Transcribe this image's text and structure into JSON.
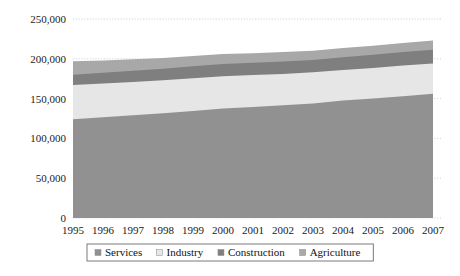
{
  "chart_data": {
    "type": "area",
    "stacked": true,
    "title": "",
    "subtitle": "",
    "xlabel": "",
    "ylabel": "",
    "categories": [
      "1995",
      "1996",
      "1997",
      "1998",
      "1999",
      "2000",
      "2001",
      "2002",
      "2003",
      "2004",
      "2005",
      "2006",
      "2007"
    ],
    "x": [
      1995,
      1996,
      1997,
      1998,
      1999,
      2000,
      2001,
      2002,
      2003,
      2004,
      2005,
      2006,
      2007
    ],
    "series": [
      {
        "name": "Services",
        "color": "#919191",
        "values": [
          124000,
          126500,
          129000,
          131500,
          134500,
          137500,
          139500,
          141500,
          144000,
          147500,
          150000,
          153000,
          156000
        ]
      },
      {
        "name": "Industry",
        "color": "#e6e6e6",
        "values": [
          43000,
          42500,
          42000,
          41500,
          41000,
          40500,
          40000,
          39500,
          39000,
          38500,
          38500,
          38500,
          38000
        ]
      },
      {
        "name": "Construction",
        "color": "#7f7f7f",
        "values": [
          13000,
          13500,
          14000,
          14500,
          15000,
          15500,
          15500,
          15500,
          15500,
          16000,
          16500,
          17000,
          17500
        ]
      },
      {
        "name": "Agriculture",
        "color": "#a8a8a8",
        "values": [
          17000,
          15500,
          14500,
          13500,
          13000,
          12500,
          12000,
          12000,
          11500,
          11500,
          11500,
          11500,
          11500
        ]
      }
    ],
    "ylim": [
      0,
      250000
    ],
    "yticks": [
      0,
      50000,
      100000,
      150000,
      200000,
      250000
    ],
    "ytick_labels": [
      "0",
      "50,000",
      "100,000",
      "150,000",
      "200,000",
      "250,000"
    ],
    "grid": true,
    "grid_axis": "y",
    "legend_position": "bottom",
    "legend_entries": [
      {
        "label": "Services",
        "color": "#919191"
      },
      {
        "label": "Industry",
        "color": "#e6e6e6"
      },
      {
        "label": "Construction",
        "color": "#7f7f7f"
      },
      {
        "label": "Agriculture",
        "color": "#a8a8a8"
      }
    ]
  }
}
